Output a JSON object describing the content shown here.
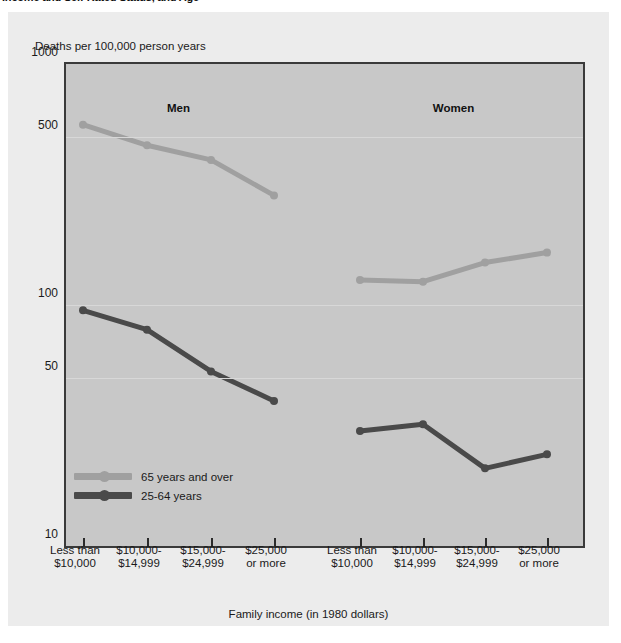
{
  "caption": {
    "text": "Income and Self-Rated Status, and Age"
  },
  "chart_data": {
    "type": "line",
    "title": "",
    "ylabel": "Deaths per 100,000 person years",
    "xlabel": "Family income (in 1980 dollars)",
    "yscale": "log",
    "ylim": [
      10,
      1000
    ],
    "yticks": [
      "1000",
      "500",
      "100",
      "50",
      "10"
    ],
    "ytick_values": [
      1000,
      500,
      100,
      50,
      10
    ],
    "grid": true,
    "legend_position": "inside-bottom-left",
    "panels": [
      {
        "label": "Men",
        "categories": [
          "Less than\n$10,000",
          "$10,000-\n$14,999",
          "$15,000-\n$24,999",
          "$25,000\nor more"
        ],
        "series": [
          {
            "name": "65 years and over",
            "values": [
              560,
              460,
              400,
              285
            ]
          },
          {
            "name": "25-64 years",
            "values": [
              95,
              79,
              53,
              40
            ]
          }
        ]
      },
      {
        "label": "Women",
        "categories": [
          "Less than\n$10,000",
          "$10,000-\n$14,999",
          "$15,000-\n$24,999",
          "$25,000\nor more"
        ],
        "series": [
          {
            "name": "65 years and over",
            "values": [
              127,
              125,
              150,
              165
            ]
          },
          {
            "name": "25-64 years",
            "values": [
              30,
              32,
              21,
              24
            ]
          }
        ]
      }
    ],
    "legend": [
      {
        "label": "65 years and over",
        "color": "#a0a0a0"
      },
      {
        "label": "25-64 years",
        "color": "#4a4a4a"
      }
    ]
  },
  "colors": {
    "series_older": "#a0a0a0",
    "series_younger": "#4a4a4a",
    "plot_background": "#c8c8c8",
    "panel_background": "#ececec",
    "axis": "#3a3a3a"
  }
}
